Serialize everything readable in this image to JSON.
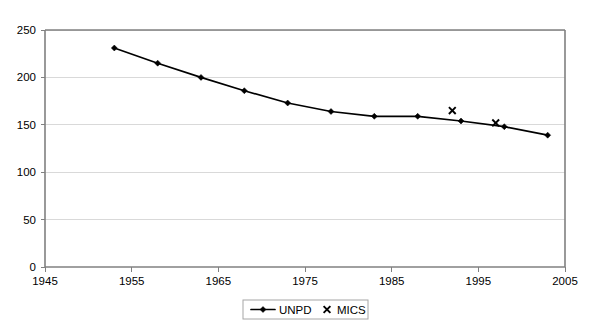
{
  "chart_data": {
    "type": "line",
    "title": "",
    "subtitle": "",
    "xlabel": "",
    "ylabel": "",
    "xlim": [
      1945,
      2005
    ],
    "ylim": [
      0,
      250
    ],
    "grid": "horizontal",
    "legend_position": "bottom-center",
    "x_ticks": [
      "1945",
      "1955",
      "1965",
      "1975",
      "1985",
      "1995",
      "2005"
    ],
    "x_tick_values": [
      1945,
      1955,
      1965,
      1975,
      1985,
      1995,
      2005
    ],
    "y_ticks": [
      "0",
      "50",
      "100",
      "150",
      "200",
      "250"
    ],
    "y_tick_values": [
      0,
      50,
      100,
      150,
      200,
      250
    ],
    "series": [
      {
        "name": "UNPD",
        "marker": "diamond",
        "line": true,
        "color": "#000000",
        "points": [
          {
            "x": 1953,
            "y": 231
          },
          {
            "x": 1958,
            "y": 215
          },
          {
            "x": 1963,
            "y": 200
          },
          {
            "x": 1968,
            "y": 186
          },
          {
            "x": 1973,
            "y": 173
          },
          {
            "x": 1978,
            "y": 164
          },
          {
            "x": 1983,
            "y": 159
          },
          {
            "x": 1988,
            "y": 159
          },
          {
            "x": 1993,
            "y": 154
          },
          {
            "x": 1998,
            "y": 148
          },
          {
            "x": 2003,
            "y": 139
          }
        ]
      },
      {
        "name": "MICS",
        "marker": "x",
        "line": false,
        "color": "#000000",
        "points": [
          {
            "x": 1992,
            "y": 165
          },
          {
            "x": 1997,
            "y": 152
          }
        ]
      }
    ]
  },
  "legend": {
    "entries": [
      {
        "label": "UNPD",
        "marker": "line-diamond"
      },
      {
        "label": "MICS",
        "marker": "x"
      }
    ]
  }
}
